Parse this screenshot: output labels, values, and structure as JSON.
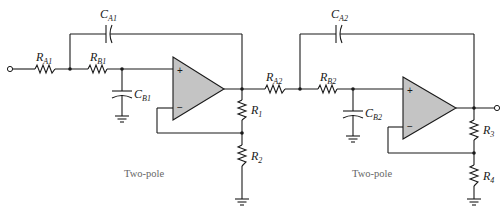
{
  "diagram": {
    "type": "circuit-schematic",
    "stages": [
      {
        "caption": "Two-pole",
        "components": {
          "RA": {
            "name": "R",
            "sub": "A1"
          },
          "RB": {
            "name": "R",
            "sub": "B1"
          },
          "CA": {
            "name": "C",
            "sub": "A1"
          },
          "CB": {
            "name": "C",
            "sub": "B1"
          },
          "Rtop": {
            "name": "R",
            "sub": "1"
          },
          "Rbot": {
            "name": "R",
            "sub": "2"
          }
        },
        "opamp": {
          "plus": "+",
          "minus": "−"
        }
      },
      {
        "caption": "Two-pole",
        "components": {
          "RA": {
            "name": "R",
            "sub": "A2"
          },
          "RB": {
            "name": "R",
            "sub": "B2"
          },
          "CA": {
            "name": "C",
            "sub": "A2"
          },
          "CB": {
            "name": "C",
            "sub": "B2"
          },
          "Rtop": {
            "name": "R",
            "sub": "3"
          },
          "Rbot": {
            "name": "R",
            "sub": "4"
          }
        },
        "opamp": {
          "plus": "+",
          "minus": "−"
        }
      }
    ],
    "colors": {
      "wire": "#1a1a1a",
      "opamp_fill": "#c4c4c4",
      "caption": "#666666"
    }
  }
}
